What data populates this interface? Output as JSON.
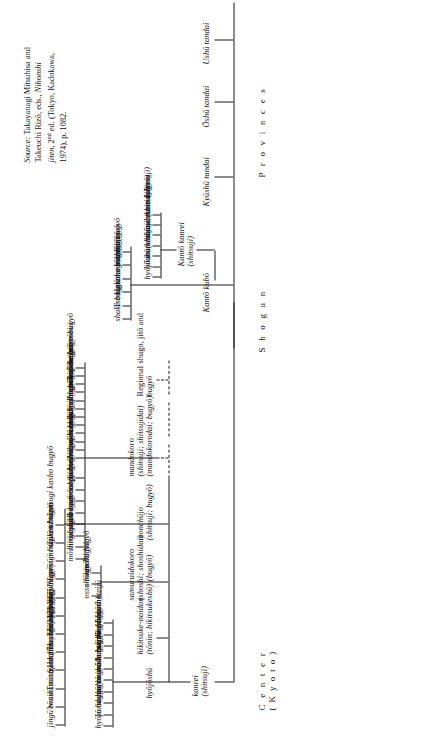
{
  "figure": {
    "kind": "organization-chart"
  },
  "tiers": [
    {
      "id": "center",
      "line1": "C e n t e r",
      "line2": "( K y o t o )"
    },
    {
      "id": "shogun",
      "line1": "S h o g u n",
      "line2": ""
    },
    {
      "id": "provinces",
      "line1": "P r o v i n c e s",
      "line2": ""
    }
  ],
  "spine": {
    "center_nodes": [
      {
        "id": "kanrei",
        "line1": "kanrei",
        "line2": "(shitsuji)"
      },
      {
        "id": "kanto-kubo",
        "line1": "Kantō kubō",
        "line2": ""
      },
      {
        "id": "kyushu",
        "line1": "Kyūshū tandai",
        "line2": ""
      },
      {
        "id": "oshu",
        "line1": "Ōshū tandai",
        "line2": ""
      },
      {
        "id": "ushu",
        "line1": "Ushū tandai",
        "line2": ""
      }
    ]
  },
  "kanrei_children": [
    {
      "id": "hyojoshu",
      "line1": "hyōjōshū",
      "line2": ""
    },
    {
      "id": "hikitsuke",
      "line1": "hikitsuke-naidan",
      "line2": "(tōnin; hikitsukeshū)"
    },
    {
      "id": "samuraidokoro",
      "line1": "samuraidokoro",
      "line2": "(shoshi; shoshidai)",
      "line3": "(bugyō)"
    },
    {
      "id": "monchujo",
      "line1": "monchūjo",
      "line2": "(shitsuji; bugyō)"
    },
    {
      "id": "mandokoro",
      "line1": "mandokoro",
      "line2": "(shitsuji; shitsujidai)",
      "line3": "(mandokorodai; bugyō)"
    },
    {
      "id": "regional",
      "line1": "Regional shugo, jitō and",
      "line2": "bugyō"
    }
  ],
  "hyojoshu_items": [
    "hyōjō bugyō",
    "kurin bugyō",
    "shugo bugyō",
    "kubariwake bugyō",
    "onshō bugyō (onshōkata)",
    "ando bugyō",
    "kanto bugyō",
    "shake bugyō",
    "jike bugyō",
    "jisha shoteijū"
  ],
  "samuraidokoro_items": [
    "osso bugyō",
    "shōnin bugyō",
    "kenshi bugyō"
  ],
  "monchujo_items": [
    "jingū tōnin",
    "Iwashimizu Hachimangū bugyō",
    "Tsurugaoka Hachimangū bugyō",
    "Sanmon",
    "(Enryakuji) bugyō",
    "Tōdaiji bugyō",
    "Kōfukuji bugyō",
    "Tōji bugyō",
    "Tenryūji bugyō",
    "zenritsukata tōnin",
    "Tōsen bugyō",
    "shukutsugi kasho bugyō"
  ],
  "monchujo_roman_flags": [
    false,
    true,
    true,
    true,
    false,
    false,
    false,
    false,
    false,
    false,
    false,
    false
  ],
  "mandokoro_items_left": [
    "mōshitsugishū",
    "hirō bugyō",
    "gosho bugyō",
    "oide bugyō",
    "omono nagamochi bugyō",
    "omono bugyō",
    "sakuji bugyō",
    "fushin bugyō"
  ],
  "mandokoro_items_right": [
    "umaya bugyō",
    "tansen bugyō",
    "nōsenkata",
    "kura bugyō",
    "origami bugyō",
    "kōba bugyō",
    "kissho bugyō",
    "gohan hajime bugyō",
    "yumihajime mato bugyō",
    "oiwai bugyō",
    "kitō bugyō",
    "odaikan mairi"
  ],
  "kanto_kanrei": {
    "line1": "Kantō kanrei",
    "line2": "(shitsuji)"
  },
  "kanto_kanrei_children": [
    {
      "text": "hyōjōshū",
      "roman": false
    },
    {
      "text": "hikitsukeshū",
      "roman": false
    },
    {
      "text": "monchūjo",
      "roman": false
    },
    {
      "text": "(shitsuji; osso bugyō)",
      "roman": false
    },
    {
      "text": "mandokoro (shitsuji)",
      "roman": false
    },
    {
      "text": "samuraidokoro",
      "roman": false
    },
    {
      "text": "(shitsuji)",
      "roman": false
    }
  ],
  "shake_branch": [
    {
      "text": "shake bugyō",
      "roman": false
    },
    {
      "text": "Tsurugaoka sōbugyō",
      "roman": true
    },
    {
      "text": "Hakone bugyō",
      "roman": true
    },
    {
      "text": "zenritsu bugyō",
      "roman": false
    },
    {
      "text": "gosho bugyō",
      "roman": false
    },
    {
      "text": "zōei bugyō",
      "roman": false
    }
  ],
  "source": {
    "heading": "Source:",
    "text_before_title": " Takayanagi Mitsuhisa and Takeuchi Rizō, eds., ",
    "title": "Nihonshi jiten",
    "text_after_title": ", 2",
    "ordinal": "nd",
    "tail": " ed. (Tokyo, Kadokawa, 1974), p. 1082."
  }
}
